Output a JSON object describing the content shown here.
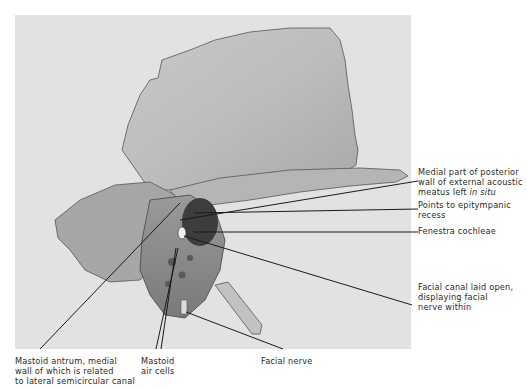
{
  "figure": {
    "background_color": "#e2e2e2",
    "line_color": "#1a1a1a"
  },
  "labels": {
    "right": [
      {
        "id": "medial-part-posterior-wall",
        "lines": [
          "Medial part of posterior",
          "wall of external acoustic",
          "meatus left "
        ],
        "italic_suffix": "in situ"
      },
      {
        "id": "epitympanic-recess",
        "lines": [
          "Points to epitympanic",
          "recess"
        ]
      },
      {
        "id": "fenestra-cochleae",
        "lines": [
          "Fenestra cochleae"
        ]
      },
      {
        "id": "facial-canal",
        "lines": [
          "Facial canal laid open,",
          "displaying facial",
          "nerve within"
        ]
      }
    ],
    "bottom": [
      {
        "id": "mastoid-antrum",
        "lines": [
          "Mastoid antrum, medial",
          "wall of which is related",
          "to lateral semicircular canal"
        ]
      },
      {
        "id": "mastoid-air-cells",
        "lines": [
          "Mastoid",
          "air cells"
        ]
      },
      {
        "id": "facial-nerve",
        "lines": [
          "Facial nerve"
        ]
      }
    ]
  },
  "text": {
    "r0_l0": "Medial part of posterior",
    "r0_l1": "wall of external acoustic",
    "r0_l2": "meatus left ",
    "r0_l2_italic": "in situ",
    "r1_l0": "Points to epitympanic",
    "r1_l1": "recess",
    "r2_l0": "Fenestra cochleae",
    "r3_l0": "Facial canal laid open,",
    "r3_l1": "displaying facial",
    "r3_l2": "nerve within",
    "b0_l0": "Mastoid antrum, medial",
    "b0_l1": "wall of which is related",
    "b0_l2": "to lateral semicircular canal",
    "b1_l0": "Mastoid",
    "b1_l1": "air cells",
    "b2_l0": "Facial nerve"
  }
}
